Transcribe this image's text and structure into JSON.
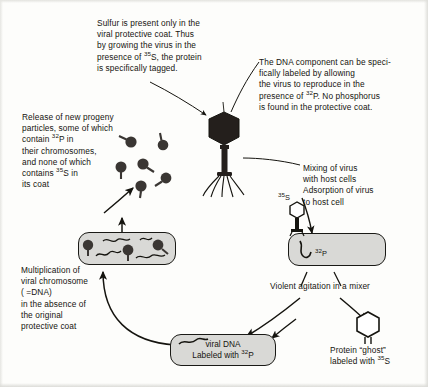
{
  "diagram": {
    "background_color": "#fdfdfb",
    "ink_color": "#15140f",
    "cell_fill_color": "#d9d9d6"
  },
  "annotations": {
    "sulfur_note": "Sulfur is present only in the\nviral protective coat. Thus\nby growing the virus in the\npresence of 35S, the protein\nis specifically tagged.",
    "sulfur_note_lines": [
      "Sulfur is present only in the",
      "viral protective coat. Thus",
      "by growing the virus in the",
      "presence of ",
      "S, the protein",
      "is specifically tagged."
    ],
    "dna_note_lines": [
      "The DNA component can be speci-",
      "fically labeled by allowing",
      "the virus to reproduce in the",
      "presence of ",
      "P. No phosphorus",
      "is found in the protective coat."
    ],
    "release_note_lines": [
      "Release of new progeny",
      "particles, some of which",
      "contain ",
      "P in",
      "their chromosomes,",
      "and none of which",
      "contains ",
      "S in",
      "its coat"
    ],
    "mixing_note_lines": [
      "Mixing of virus",
      "with host cells",
      "Adsorption of virus",
      "to host cell"
    ],
    "multiplication_note_lines": [
      "Multiplication of",
      "viral chromosome",
      "( =DNA)",
      "in the absence of",
      "the original",
      "protective coat"
    ],
    "agitation_label": "Violent agitation in a mixer",
    "ghost_label_lines": [
      "Protein “ghost”",
      "labeled with ",
      "S"
    ]
  },
  "isotopes": {
    "s35": "35S",
    "s35_sup": "35",
    "s35_base": "S",
    "p32": "32P",
    "p32_sup": "32",
    "p32_base": "P"
  },
  "labels": {
    "phage_s35_marker": "35S",
    "host_cell_p32_marker": "32P",
    "viral_dna_box_line1": "viral DNA",
    "viral_dna_box_line2": "Labeled with ",
    "viral_dna_box_line2_sup": "32",
    "viral_dna_box_line2_base": "P"
  },
  "elements": {
    "central_phage": "bacteriophage-icon",
    "progeny_phages": "progeny-phage-particles",
    "infected_cell": "host-cell-with-phage-dna",
    "adsorbed_cell": "host-cell-with-adsorbed-phage",
    "viral_dna_box": "viral-dna-result-box",
    "ghost_icon": "protein-ghost-icon"
  }
}
